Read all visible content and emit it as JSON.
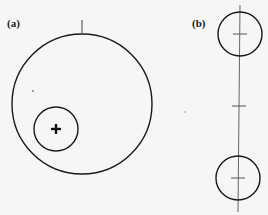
{
  "panels": {
    "a": {
      "label": "(a)",
      "center_marker": "+"
    },
    "b": {
      "label": "(b)"
    }
  },
  "colors": {
    "stroke": "#1a1a1a",
    "background": "#f6f6f4",
    "thin_line": "#555555"
  }
}
